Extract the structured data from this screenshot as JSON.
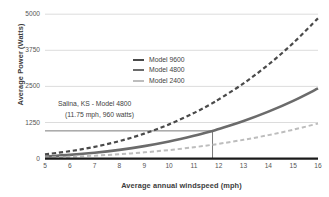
{
  "chart_data": {
    "type": "line",
    "title": "",
    "xlabel": "Average annual windspeed (mph)",
    "ylabel": "Average Power (Watts)",
    "xlim": [
      5,
      16
    ],
    "ylim": [
      0,
      5000
    ],
    "xticks": [
      5,
      6,
      7,
      8,
      9,
      10,
      11,
      12,
      13,
      14,
      15,
      16
    ],
    "yticks": [
      0,
      1250,
      2500,
      3750,
      5000
    ],
    "xtick_labels": [
      "5",
      "6",
      "7",
      "8",
      "9",
      "10",
      "11",
      "12",
      "13",
      "14",
      "15",
      "16"
    ],
    "ytick_labels": [
      "0",
      "1250",
      "2500",
      "3750",
      "5000"
    ],
    "grid": true,
    "grid_axis": "y",
    "legend_position": "upper-center-left",
    "series": [
      {
        "name": "Model 9600",
        "color": "#4a4a4a",
        "style": "dashed",
        "width": 2.2,
        "x": [
          5,
          6,
          7,
          8,
          9,
          10,
          11,
          11.75,
          12,
          13,
          14,
          15,
          16
        ],
        "values": [
          148,
          256,
          407,
          607,
          864,
          1185,
          1578,
          1920,
          2049,
          2604,
          3253,
          4001,
          4858
        ]
      },
      {
        "name": "Model 4800",
        "color": "#6b6b6b",
        "style": "solid",
        "width": 2.6,
        "x": [
          5,
          6,
          7,
          8,
          9,
          10,
          11,
          11.75,
          12,
          13,
          14,
          15,
          16
        ],
        "values": [
          74,
          128,
          203,
          303,
          432,
          592,
          789,
          960,
          1025,
          1302,
          1626,
          2000,
          2429
        ]
      },
      {
        "name": "Model 2400",
        "color": "#bdbdbd",
        "style": "dashed",
        "width": 2.0,
        "x": [
          5,
          6,
          7,
          8,
          9,
          10,
          11,
          11.75,
          12,
          13,
          14,
          15,
          16
        ],
        "values": [
          37,
          64,
          101,
          152,
          216,
          296,
          394,
          480,
          512,
          651,
          813,
          1000,
          1215
        ]
      }
    ],
    "annotations": [
      {
        "name": "salina-callout",
        "line1": "Salina, KS - Model 4800",
        "line2": "(11.75 mph, 960 watts)",
        "marker_x": 11.75,
        "marker_y": 960,
        "marker_color": "#6b6b6b"
      }
    ]
  },
  "legend": {
    "items": [
      {
        "label": "Model 9600"
      },
      {
        "label": "Model 4800"
      },
      {
        "label": "Model 2400"
      }
    ]
  },
  "axes": {
    "x_title": "Average annual windspeed (mph)",
    "y_title": "Average Power (Watts)"
  },
  "colors": {
    "model_9600": "#4a4a4a",
    "model_4800": "#6b6b6b",
    "model_2400": "#bdbdbd",
    "grid": "#d8d8d8",
    "axis": "#1a1a1a",
    "text": "#3f3f3f",
    "background": "#ffffff"
  }
}
